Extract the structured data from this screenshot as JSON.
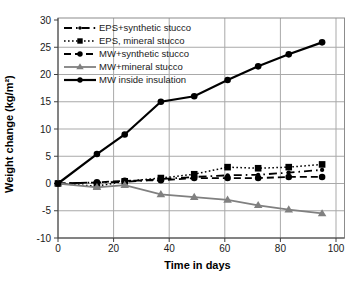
{
  "figure": {
    "background": "#ffffff",
    "plot_border_color": "#8c8c8c",
    "grid_color": "#a9a9a9",
    "axis_color": "#404040",
    "text_color": "#1a1a1a"
  },
  "chart_data": {
    "type": "line",
    "title": "",
    "xlabel": "Time in days",
    "ylabel": "Weight change (kg/m²)",
    "x": [
      0,
      14,
      24,
      37,
      49,
      61,
      72,
      83,
      95
    ],
    "xlim": [
      0,
      103
    ],
    "ylim": [
      -10,
      30
    ],
    "x_ticks": [
      0,
      20,
      40,
      60,
      80,
      100
    ],
    "y_ticks": [
      30,
      25,
      20,
      15,
      10,
      5,
      0,
      -5,
      -10
    ],
    "grid": true,
    "legend_position": "top-left-inside",
    "series": [
      {
        "name": "EPS+synthetic stucco",
        "values": [
          0,
          0.2,
          0.3,
          0.8,
          1.2,
          1.5,
          1.6,
          2.0,
          2.5
        ],
        "color": "#000000",
        "line": "dashdot",
        "marker": "dot",
        "width": 1.8
      },
      {
        "name": "EPS, mineral stucco",
        "values": [
          0,
          -0.5,
          0.4,
          1.0,
          1.7,
          3.0,
          2.8,
          3.0,
          3.5
        ],
        "color": "#000000",
        "line": "dotted",
        "marker": "square",
        "width": 1.5
      },
      {
        "name": "MW+synthetic stucco",
        "values": [
          0,
          0.2,
          0.5,
          0.6,
          1.0,
          1.0,
          1.0,
          1.2,
          1.2
        ],
        "color": "#000000",
        "line": "dashed",
        "marker": "circle",
        "width": 1.8
      },
      {
        "name": "MW+mineral stucco",
        "values": [
          0,
          -0.7,
          -0.3,
          -2.0,
          -2.5,
          -3.0,
          -4.0,
          -4.8,
          -5.5
        ],
        "color": "#808080",
        "line": "solid",
        "marker": "triangle",
        "width": 1.8
      },
      {
        "name": "MW inside insulation",
        "values": [
          0,
          5.4,
          9.0,
          15.0,
          16.0,
          19.0,
          21.5,
          23.7,
          25.9
        ],
        "color": "#000000",
        "line": "solid",
        "marker": "circle",
        "width": 2.2
      }
    ]
  }
}
